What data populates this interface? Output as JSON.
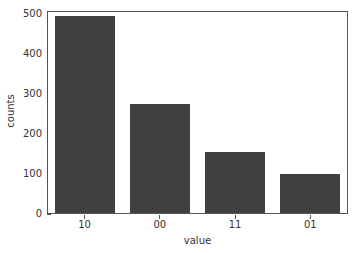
{
  "chart_data": {
    "type": "bar",
    "title": "",
    "xlabel": "value",
    "ylabel": "counts",
    "categories": [
      "10",
      "00",
      "11",
      "01"
    ],
    "values": [
      493,
      272,
      152,
      98
    ],
    "yticks": [
      0,
      100,
      200,
      300,
      400,
      500
    ],
    "ytick_labels": [
      "0",
      "100",
      "200",
      "300",
      "400",
      "500"
    ],
    "ylim": [
      0,
      508
    ],
    "xtick_labels": [
      "10",
      "00",
      "11",
      "01"
    ],
    "grid": false,
    "legend": null,
    "bar_color": "#404040",
    "background_color": "#ffffff",
    "axis_color": "#555555",
    "text_color": "#333333"
  }
}
